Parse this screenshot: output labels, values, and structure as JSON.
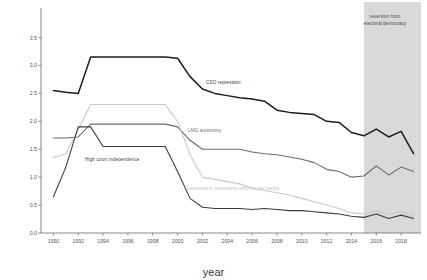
{
  "chart_data": {
    "type": "line",
    "title": "",
    "xlabel": "year",
    "ylabel": "",
    "xlim": [
      1989,
      2019.6
    ],
    "ylim": [
      0.0,
      3.85
    ],
    "grid": false,
    "legend": "inline-labels",
    "x": [
      1990,
      1991,
      1992,
      1993,
      1994,
      1995,
      1996,
      1997,
      1998,
      1999,
      2000,
      2001,
      2002,
      2003,
      2004,
      2005,
      2006,
      2007,
      2008,
      2009,
      2010,
      2011,
      2012,
      2013,
      2014,
      2015,
      2016,
      2017,
      2018,
      2019
    ],
    "xticks": [
      "1990",
      "1992",
      "1994",
      "1996",
      "1998",
      "2000",
      "2002",
      "2004",
      "2006",
      "2008",
      "2010",
      "2012",
      "2014",
      "2016",
      "2018"
    ],
    "xtick_values": [
      1990,
      1992,
      1994,
      1996,
      1998,
      2000,
      2002,
      2004,
      2006,
      2008,
      2010,
      2012,
      2014,
      2016,
      2018
    ],
    "yticks": [
      "0.0",
      "0.5",
      "1.0",
      "1.5",
      "2.0",
      "2.5",
      "3.0",
      "3.5"
    ],
    "ytick_values": [
      0.0,
      0.5,
      1.0,
      1.5,
      2.0,
      2.5,
      3.0,
      3.5
    ],
    "series": [
      {
        "name": "CSO repression",
        "color": "#1c1c1c",
        "width": 1.5,
        "label_x": 2003,
        "label_y": 2.62,
        "values": [
          2.55,
          2.52,
          2.5,
          3.15,
          3.15,
          3.15,
          3.15,
          3.15,
          3.15,
          3.15,
          3.13,
          2.8,
          2.58,
          2.5,
          2.46,
          2.42,
          2.4,
          2.36,
          2.2,
          2.16,
          2.14,
          2.12,
          2.0,
          1.98,
          1.8,
          1.74,
          1.86,
          1.72,
          1.82,
          1.42
        ]
      },
      {
        "name": "LMG autonomy",
        "color": "#6b6b6b",
        "width": 1.1,
        "label_x": 2001,
        "label_y": 1.62,
        "values": [
          1.7,
          1.7,
          1.72,
          1.95,
          1.95,
          1.95,
          1.95,
          1.95,
          1.95,
          1.95,
          1.9,
          1.66,
          1.5,
          1.5,
          1.5,
          1.5,
          1.45,
          1.42,
          1.4,
          1.36,
          1.32,
          1.26,
          1.14,
          1.1,
          1.0,
          1.02,
          1.2,
          1.04,
          1.18,
          1.1
        ]
      },
      {
        "name": "Government censorship effort in the media",
        "color": "#c9c9c9",
        "width": 1.1,
        "label_x": 2001,
        "label_y": 0.78,
        "values": [
          1.35,
          1.42,
          1.85,
          2.3,
          2.3,
          2.3,
          2.3,
          2.3,
          2.3,
          2.3,
          2.0,
          1.4,
          1.0,
          0.96,
          0.92,
          0.88,
          0.8,
          0.76,
          0.72,
          0.68,
          0.62,
          0.56,
          0.5,
          0.44,
          0.36,
          0.34,
          0.4,
          0.33,
          0.38,
          0.3
        ]
      },
      {
        "name": "High court independence",
        "color": "#3d3d3d",
        "width": 1.1,
        "label_x": 1996,
        "label_y": 0.98,
        "values": [
          0.65,
          1.18,
          1.9,
          1.9,
          1.55,
          1.55,
          1.55,
          1.55,
          1.55,
          1.55,
          1.1,
          0.62,
          0.46,
          0.44,
          0.44,
          0.44,
          0.42,
          0.44,
          0.42,
          0.4,
          0.4,
          0.38,
          0.36,
          0.34,
          0.3,
          0.28,
          0.34,
          0.26,
          0.32,
          0.26
        ]
      }
    ],
    "annotations": [
      {
        "name": "reversion-band",
        "text": "reversion from electoral democracy",
        "x_start": 2015,
        "x_end": 2019.6,
        "color": "#d9d9d9"
      }
    ]
  },
  "axis": {
    "xlabel": "year"
  },
  "annotation_text": {
    "reversion_line1": "reversion from",
    "reversion_line2": "electoral democracy"
  }
}
